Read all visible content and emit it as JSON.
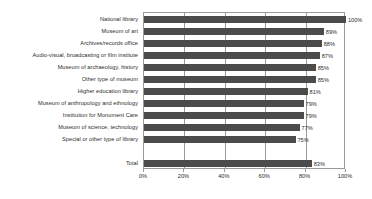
{
  "chart_data": {
    "type": "bar",
    "orientation": "horizontal",
    "title": "",
    "subtitle": "",
    "xlabel": "",
    "ylabel": "",
    "xlim": [
      0,
      100
    ],
    "grid": true,
    "legend": null,
    "legend_position": "none",
    "value_suffix": "%",
    "xticks": [
      "0%",
      "20%",
      "40%",
      "60%",
      "80%",
      "100%"
    ],
    "xtick_values": [
      0,
      20,
      40,
      60,
      80,
      100
    ],
    "categories": [
      "National library",
      "Museum of art",
      "Archives/records office",
      "Audio-visual, broadcasting or film institute",
      "Museum of archaeology, history",
      "Other type of museum",
      "Higher education library",
      "Museum of anthropology and ethnology",
      "Institution for Monument Care",
      "Museum of science, technology",
      "Special or other type of library"
    ],
    "values": [
      100,
      89,
      88,
      87,
      85,
      85,
      81,
      79,
      79,
      77,
      75
    ],
    "value_labels": [
      "100%",
      "89%",
      "88%",
      "87%",
      "85%",
      "85%",
      "81%",
      "79%",
      "79%",
      "77%",
      "75%"
    ],
    "total_category": "Total",
    "total_value": 83,
    "total_label": "83%",
    "bar_color": "#4b4b4b",
    "plot_background": "#ffffff",
    "border_color": "#9a9a9a",
    "text_color": "#2b2b2b"
  }
}
